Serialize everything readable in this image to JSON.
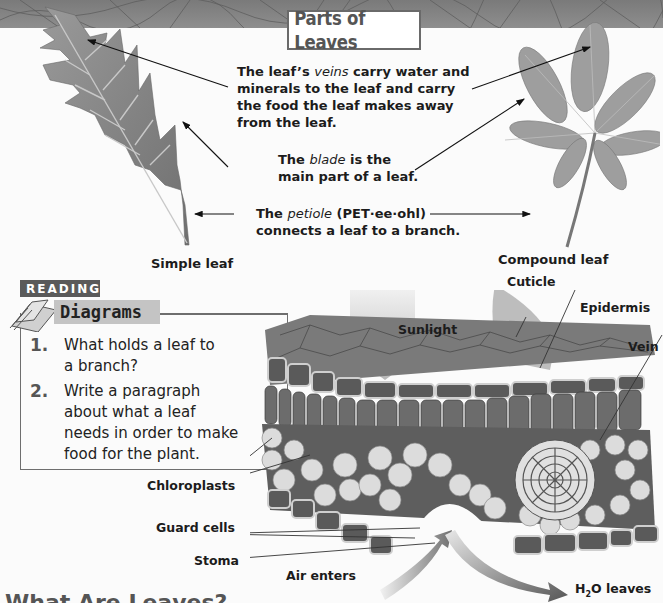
{
  "page": {
    "title": "Parts of Leaves",
    "bottom_heading_partial": "What Are Leaves?"
  },
  "callouts": {
    "veins": {
      "prefix": "The leaf’s ",
      "term": "veins",
      "line1_rest": " carry water and",
      "line2": "minerals to the leaf and carry",
      "line3": "the food the leaf makes away",
      "line4": "from the leaf."
    },
    "blade": {
      "prefix": "The ",
      "term": "blade",
      "line1_rest": " is the",
      "line2": "main part of a leaf."
    },
    "petiole": {
      "prefix": "The ",
      "term": "petiole",
      "line1_rest": " (PET·ee·ohl)",
      "line2": "connects a leaf to a branch."
    }
  },
  "leaf_labels": {
    "simple": "Simple leaf",
    "compound": "Compound leaf"
  },
  "reading_diagrams": {
    "tag": "READING",
    "title": "Diagrams",
    "questions": [
      {
        "number": "1.",
        "line1": "What holds a leaf to",
        "line2": "a branch?"
      },
      {
        "number": "2.",
        "line1": "Write a paragraph",
        "line2": "about what a leaf",
        "line3": "needs in order to make",
        "line4": "food for the plant."
      }
    ]
  },
  "cross_section_labels": {
    "cuticle": "Cuticle",
    "epidermis": "Epidermis",
    "vein": "Vein",
    "sunlight": "Sunlight",
    "chloroplasts": "Chloroplasts",
    "guard_cells": "Guard cells",
    "stoma": "Stoma",
    "air_enters": "Air enters",
    "h2o_leaves_pre": "H",
    "h2o_leaves_sub": "2",
    "h2o_leaves_post": "O leaves"
  },
  "colors": {
    "band": "#808080",
    "tag_dark": "#5a5a5a",
    "tag_light": "#c4c4c4",
    "leaf": "#8a8a8a",
    "cell_dark": "#6e6e6e",
    "cell_light": "#d8d8d8"
  }
}
